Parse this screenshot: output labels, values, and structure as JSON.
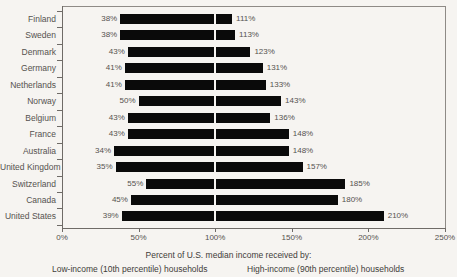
{
  "chart_data": {
    "type": "bar",
    "title": "",
    "subtitle": "",
    "xlabel": "Percent of U.S. median income received by:",
    "ylabel": "",
    "xlim": [
      0,
      250
    ],
    "xticks": [
      0,
      50,
      100,
      150,
      200,
      250
    ],
    "xtick_labels": [
      "0%",
      "50%",
      "100%",
      "150%",
      "200%",
      "250%"
    ],
    "grid": false,
    "reference_line": 100,
    "legend_position": "below",
    "orientation": "horizontal",
    "bar_style": "range-bar (low-income value to high-income value)",
    "categories": [
      "Finland",
      "Sweden",
      "Denmark",
      "Germany",
      "Netherlands",
      "Norway",
      "Belgium",
      "France",
      "Australia",
      "United Kingdom",
      "Switzerland",
      "Canada",
      "United States"
    ],
    "series": [
      {
        "name": "Low-income (10th percentile) households",
        "values": [
          38,
          38,
          43,
          41,
          41,
          50,
          43,
          43,
          34,
          35,
          55,
          45,
          39
        ],
        "labels": [
          "38%",
          "38%",
          "43%",
          "41%",
          "41%",
          "50%",
          "43%",
          "43%",
          "34%",
          "35%",
          "55%",
          "45%",
          "39%"
        ]
      },
      {
        "name": "High-income (90th percentile) households",
        "values": [
          111,
          113,
          123,
          131,
          133,
          143,
          136,
          148,
          148,
          157,
          185,
          180,
          210
        ],
        "labels": [
          "111%",
          "113%",
          "123%",
          "131%",
          "133%",
          "143%",
          "136%",
          "148%",
          "148%",
          "157%",
          "185%",
          "180%",
          "210%"
        ]
      }
    ]
  },
  "captions": {
    "main": "Percent of U.S. median income received by:",
    "low": "Low-income (10th percentile)  households",
    "high": "High-income (90th percentile) households"
  },
  "colors": {
    "bar": "#0a0a0a",
    "background": "#f6f4f1",
    "axis": "#6f6b67",
    "text": "#55524f"
  }
}
